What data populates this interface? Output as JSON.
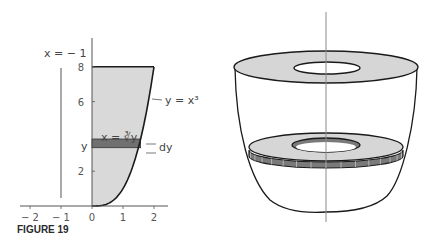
{
  "figure": {
    "caption": "FIGURE 19",
    "left_panel": {
      "axis_line_label": "x = − 1",
      "curve_label": "y = x³",
      "strip_label": "x = ∛y",
      "strip_y_label": "y",
      "strip_height_label": "dy",
      "x_ticks": [
        "− 2",
        "− 1",
        "0",
        "1",
        "2"
      ],
      "y_ticks": [
        "2",
        "4",
        "6",
        "8"
      ],
      "x_tick_values": [
        -2,
        -1,
        0,
        1,
        2
      ],
      "y_tick_values": [
        2,
        6,
        8
      ],
      "region": {
        "curve": "y = x^3",
        "x_range": [
          0,
          2
        ],
        "y_range": [
          0,
          8
        ]
      },
      "strip_y": 3.6,
      "axis_of_rotation_x": -1
    },
    "right_panel": {
      "description": "solid of revolution with washer cross-section"
    },
    "colors": {
      "region_fill": "#d9d9d9",
      "strip_fill": "#707070",
      "stroke": "#1a1a1a",
      "axis": "#555555"
    }
  }
}
